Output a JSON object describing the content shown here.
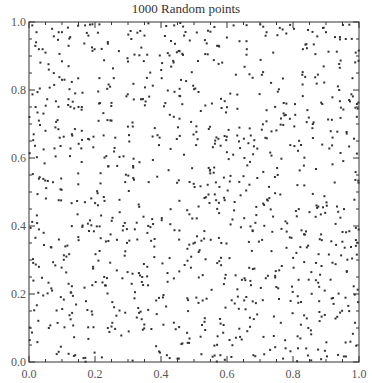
{
  "chart_data": {
    "type": "scatter",
    "title": "1000 Random points",
    "xlabel": "",
    "ylabel": "",
    "xlim": [
      0.0,
      1.0
    ],
    "ylim": [
      0.0,
      1.0
    ],
    "x_ticks": [
      "0.0",
      "0.2",
      "0.4",
      "0.6",
      "0.8",
      "1.0"
    ],
    "y_ticks": [
      "0.0",
      "0.2",
      "0.4",
      "0.6",
      "0.8",
      "1.0"
    ],
    "minor_tick_step": 0.05,
    "grid": false,
    "legend": null,
    "marker": {
      "shape": "square",
      "size_px": 2,
      "color": "#333333"
    },
    "n_points": 1000,
    "distribution": "uniform random in [0,1]x[0,1]",
    "sample_points_read_from_image": [
      [
        0.01,
        0.99
      ],
      [
        0.07,
        0.98
      ],
      [
        0.09,
        0.97
      ],
      [
        0.1,
        0.97
      ],
      [
        0.17,
        0.99
      ],
      [
        0.03,
        0.92
      ],
      [
        0.05,
        0.91
      ],
      [
        0.18,
        0.96
      ],
      [
        0.12,
        0.87
      ],
      [
        0.02,
        0.75
      ],
      [
        0.06,
        0.86
      ],
      [
        0.1,
        0.83
      ],
      [
        0.14,
        0.79
      ],
      [
        0.03,
        0.71
      ],
      [
        0.15,
        0.75
      ],
      [
        0.16,
        0.75
      ],
      [
        0.05,
        0.68
      ],
      [
        0.08,
        0.69
      ],
      [
        0.13,
        0.67
      ],
      [
        0.16,
        0.68
      ],
      [
        0.44,
        0.99
      ],
      [
        0.31,
        0.95
      ],
      [
        0.35,
        0.96
      ],
      [
        0.47,
        0.96
      ],
      [
        0.62,
        0.99
      ],
      [
        0.57,
        0.93
      ],
      [
        0.66,
        0.92
      ],
      [
        0.72,
        0.97
      ],
      [
        0.74,
        0.91
      ],
      [
        0.83,
        0.92
      ],
      [
        0.9,
        0.97
      ],
      [
        0.96,
        0.95
      ],
      [
        0.99,
        0.91
      ],
      [
        0.94,
        0.8
      ],
      [
        0.78,
        0.76
      ],
      [
        0.86,
        0.7
      ],
      [
        0.92,
        0.66
      ],
      [
        0.03,
        0.39
      ],
      [
        0.11,
        0.34
      ],
      [
        0.03,
        0.28
      ],
      [
        0.07,
        0.21
      ],
      [
        0.12,
        0.23
      ],
      [
        0.06,
        0.1
      ],
      [
        0.09,
        0.03
      ],
      [
        0.14,
        0.02
      ],
      [
        0.45,
        0.01
      ],
      [
        0.58,
        0.02
      ],
      [
        0.68,
        0.02
      ],
      [
        0.77,
        0.01
      ],
      [
        0.84,
        0.04
      ]
    ]
  },
  "render": {
    "seed": 20240611,
    "plot_left_px": 29,
    "plot_top_px": 22,
    "plot_width_px": 330,
    "plot_height_px": 340
  }
}
